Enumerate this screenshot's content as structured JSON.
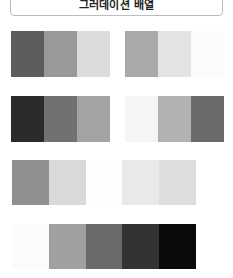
{
  "header": {
    "title": "그러데이션 배열"
  },
  "rows": [
    {
      "name": "row-1-left",
      "colors": [
        "#5d5d5d",
        "#999999",
        "#dcdcdc"
      ]
    },
    {
      "name": "row-1-right",
      "colors": [
        "#a9a9a9",
        "#e3e3e3",
        "#fbfbfb"
      ]
    },
    {
      "name": "row-2-left",
      "colors": [
        "#2a2a2a",
        "#717171",
        "#a3a3a3"
      ]
    },
    {
      "name": "row-2-right",
      "colors": [
        "#f5f5f5",
        "#b2b2b2",
        "#6b6b6b"
      ]
    },
    {
      "name": "row-3",
      "colors": [
        "#8f8f8f",
        "#d9d9d9",
        "#fefefe",
        "#e9e9e9",
        "#dedede"
      ]
    },
    {
      "name": "row-4",
      "colors": [
        "#fbfbfb",
        "#a0a0a0",
        "#6a6a6a",
        "#333333",
        "#0a0a0a"
      ]
    }
  ]
}
